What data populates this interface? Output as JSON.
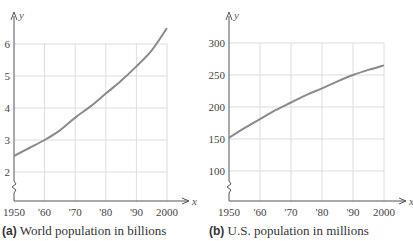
{
  "chart_data": [
    {
      "type": "line",
      "title": "World population in billions",
      "caption_tag": "(a)",
      "xlabel": "x",
      "ylabel": "y",
      "x_ticks": [
        "1950",
        "'60",
        "'70",
        "'80",
        "'90",
        "2000"
      ],
      "y_ticks": [
        "2",
        "3",
        "4",
        "5",
        "6"
      ],
      "xlim": [
        1950,
        2000
      ],
      "ylim": [
        1.2,
        6.7
      ],
      "y_axis_break": true,
      "grid": true,
      "series": [
        {
          "name": "World population (billions)",
          "x": [
            1950,
            1955,
            1960,
            1965,
            1970,
            1975,
            1980,
            1985,
            1990,
            1995,
            2000
          ],
          "y": [
            2.5,
            2.75,
            3.0,
            3.3,
            3.7,
            4.05,
            4.45,
            4.85,
            5.3,
            5.8,
            6.5
          ]
        }
      ]
    },
    {
      "type": "line",
      "title": "U.S. population in millions",
      "caption_tag": "(b)",
      "xlabel": "x",
      "ylabel": "y",
      "x_ticks": [
        "1950",
        "'60",
        "'70",
        "'80",
        "'90",
        "2000"
      ],
      "y_ticks": [
        "100",
        "150",
        "200",
        "250",
        "300"
      ],
      "xlim": [
        1950,
        2000
      ],
      "ylim": [
        55,
        340
      ],
      "y_axis_break": true,
      "grid": true,
      "series": [
        {
          "name": "U.S. population (millions)",
          "x": [
            1950,
            1955,
            1960,
            1965,
            1970,
            1975,
            1980,
            1985,
            1990,
            1995,
            2000
          ],
          "y": [
            152,
            167,
            181,
            195,
            207,
            219,
            229,
            240,
            250,
            258,
            265
          ]
        }
      ]
    }
  ],
  "captions": {
    "a": {
      "tag": "(a)",
      "text": "World population in billions"
    },
    "b": {
      "tag": "(b)",
      "text": "U.S. population in millions"
    }
  },
  "colors": {
    "curve": "#8a8a8a",
    "grid": "#dcdcdc",
    "axis": "#555555"
  }
}
